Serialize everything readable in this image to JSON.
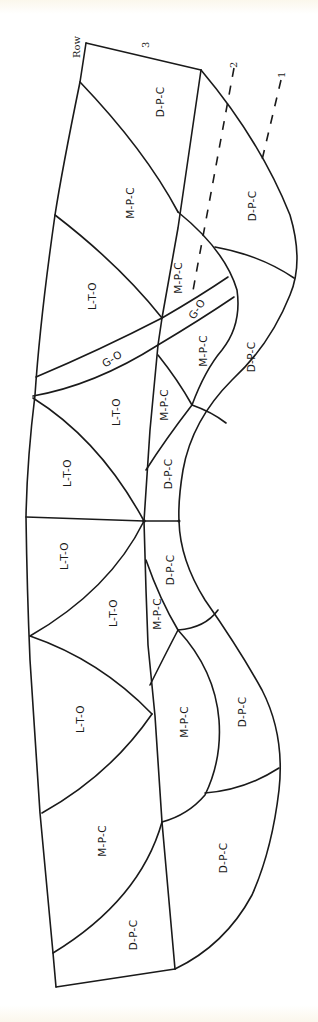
{
  "figure": {
    "orientation": "rotated 90° counter-clockwise (text reads bottom-to-top)",
    "row_axis": {
      "title": "Row",
      "rows": [
        {
          "id": "row-3",
          "label": "3"
        },
        {
          "id": "row-2",
          "label": "2"
        },
        {
          "id": "row-1",
          "label": "1"
        }
      ]
    },
    "regions": [
      {
        "id": "r1",
        "label": "D-P-C"
      },
      {
        "id": "r2",
        "label": "M-P-C"
      },
      {
        "id": "r3",
        "label": "D-P-C"
      },
      {
        "id": "r4",
        "label": "L-T-O"
      },
      {
        "id": "r5",
        "label": "M-P-C"
      },
      {
        "id": "r6",
        "label": "G-O"
      },
      {
        "id": "r7",
        "label": "G-O"
      },
      {
        "id": "r8",
        "label": "M-P-C"
      },
      {
        "id": "r9",
        "label": "D-P-C"
      },
      {
        "id": "r10",
        "label": "L-T-O"
      },
      {
        "id": "r11",
        "label": "M-P-C"
      },
      {
        "id": "r12",
        "label": "L-T-O"
      },
      {
        "id": "r13",
        "label": "D-P-C"
      },
      {
        "id": "r14",
        "label": "L-T-O"
      },
      {
        "id": "r15",
        "label": "D-P-C"
      },
      {
        "id": "r16",
        "label": "L-T-O"
      },
      {
        "id": "r17",
        "label": "M-P-C"
      },
      {
        "id": "r18",
        "label": "L-T-O"
      },
      {
        "id": "r19",
        "label": "M-P-C"
      },
      {
        "id": "r20",
        "label": "D-P-C"
      },
      {
        "id": "r21",
        "label": "M-P-C"
      },
      {
        "id": "r22",
        "label": "D-P-C"
      },
      {
        "id": "r23",
        "label": "D-P-C"
      }
    ],
    "colors": {
      "line": "#1a1a1a",
      "background": "#ffffff",
      "paper_edge": "#fbf7ec"
    }
  }
}
